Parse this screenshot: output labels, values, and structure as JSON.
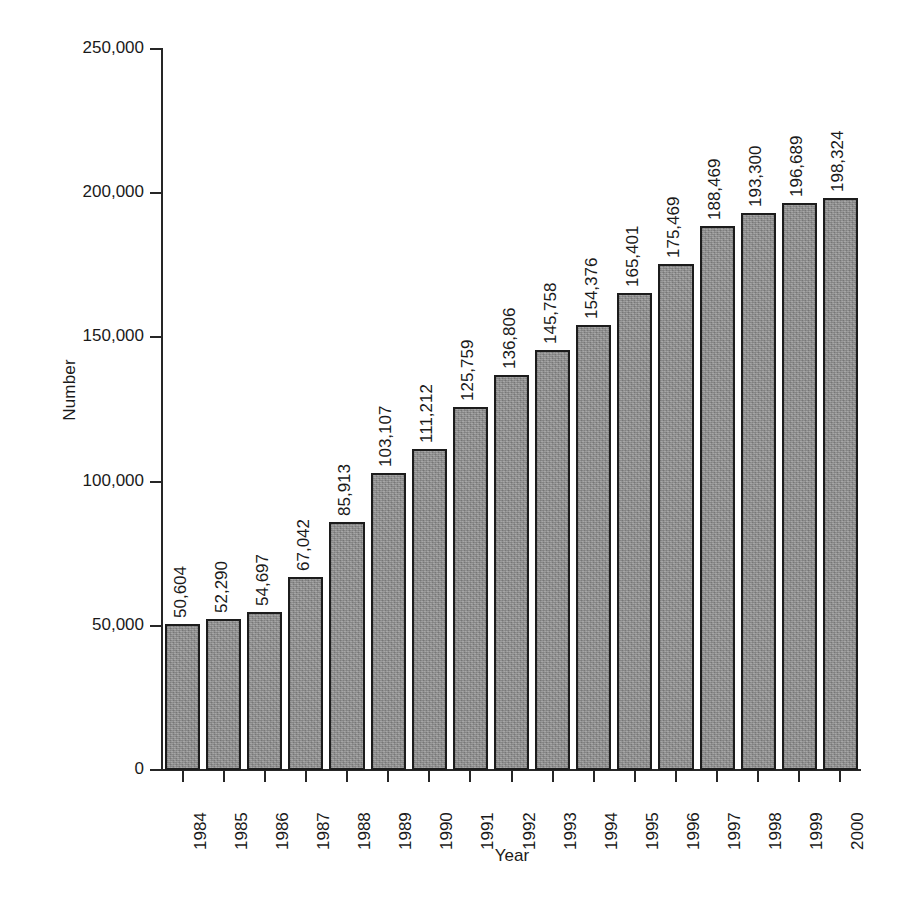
{
  "chart_data": {
    "type": "bar",
    "title": "",
    "subtitle": "",
    "xlabel": "Year",
    "ylabel": "Number",
    "categories": [
      "1984",
      "1985",
      "1986",
      "1987",
      "1988",
      "1989",
      "1990",
      "1991",
      "1992",
      "1993",
      "1994",
      "1995",
      "1996",
      "1997",
      "1998",
      "1999",
      "2000"
    ],
    "values": [
      50604,
      52290,
      54697,
      67042,
      85913,
      103107,
      111212,
      125759,
      136806,
      145758,
      154376,
      165401,
      175469,
      188469,
      193300,
      196689,
      198324
    ],
    "value_labels": [
      "50,604",
      "52,290",
      "54,697",
      "67,042",
      "85,913",
      "103,107",
      "111,212",
      "125,759",
      "136,806",
      "145,758",
      "154,376",
      "165,401",
      "175,469",
      "188,469",
      "193,300",
      "196,689",
      "198,324"
    ],
    "ylim": [
      0,
      250000
    ],
    "ytick_values": [
      0,
      50000,
      100000,
      150000,
      200000,
      250000
    ],
    "ytick_labels": [
      "0",
      "50,000",
      "100,000",
      "150,000",
      "200,000",
      "250,000"
    ],
    "grid": false,
    "legend": null,
    "legend_position": "none",
    "bar_fill_color": "#8e8e8e",
    "bar_border_color": "#1c1c1c",
    "axis_color": "#262626",
    "background_color": "#ffffff",
    "value_label_rotation": 90,
    "xtick_label_rotation": 90
  }
}
